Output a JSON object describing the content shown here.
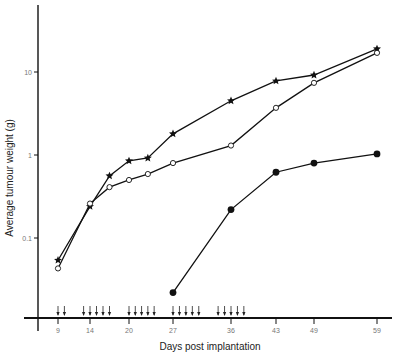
{
  "chart_data": {
    "type": "line",
    "title": "",
    "xlabel": "Days post implantation",
    "ylabel": "Average tumour weight (g)",
    "yscale": "log",
    "ylim": [
      0.01,
      40
    ],
    "xlim": [
      6,
      62
    ],
    "grid": false,
    "legend": null,
    "x_ticks": [
      9,
      14,
      20,
      27,
      36,
      43,
      49,
      59
    ],
    "y_ticks": [
      {
        "value": 0.1,
        "label": "0.1"
      },
      {
        "value": 1,
        "label": "1"
      },
      {
        "value": 10,
        "label": "10"
      }
    ],
    "series": [
      {
        "name": "Stars",
        "marker": "star",
        "x": [
          9,
          14,
          17,
          20,
          23,
          27,
          36,
          43,
          49,
          59
        ],
        "values": [
          0.054,
          0.24,
          0.56,
          0.85,
          0.92,
          1.8,
          4.5,
          7.8,
          9.2,
          19
        ]
      },
      {
        "name": "Open circles",
        "marker": "open-circle",
        "x": [
          9,
          14,
          17,
          20,
          23,
          27,
          36,
          43,
          49,
          59
        ],
        "values": [
          0.043,
          0.26,
          0.41,
          0.5,
          0.59,
          0.8,
          1.3,
          3.7,
          7.4,
          17
        ]
      },
      {
        "name": "Filled circles",
        "marker": "filled-circle",
        "x": [
          27,
          36,
          43,
          49,
          59
        ],
        "values": [
          0.022,
          0.22,
          0.62,
          0.8,
          1.03
        ]
      }
    ],
    "annotations": {
      "treatment_arrows_days": [
        9,
        10,
        13,
        14,
        15,
        16,
        17,
        20,
        21,
        22,
        23,
        24,
        27,
        28,
        29,
        30,
        31,
        34,
        35,
        36,
        37,
        38
      ],
      "description": "Downward arrows above the x-axis marking treatment days"
    }
  },
  "axes": {
    "x_title": "Days post implantation",
    "y_title": "Average tumour weight (g)"
  }
}
